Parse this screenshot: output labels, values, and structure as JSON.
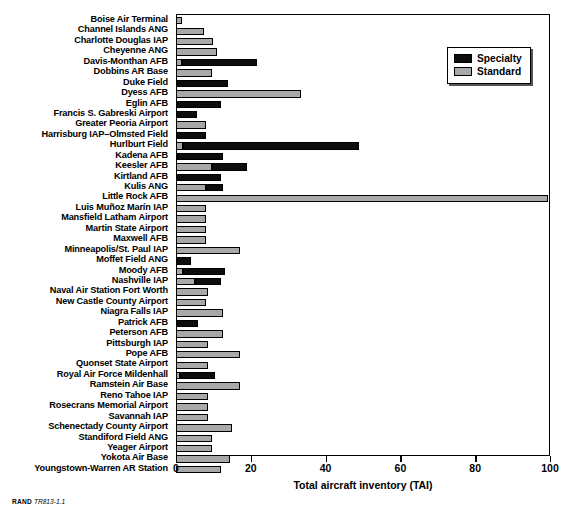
{
  "figure": {
    "footer_label": "RAND",
    "footer_code": "TR813-1.1"
  },
  "legend": {
    "position": "top-right",
    "entries": [
      {
        "label": "Specialty",
        "color": "#0d0d0d"
      },
      {
        "label": "Standard",
        "color": "#a8a8a8"
      }
    ]
  },
  "chart_data": {
    "type": "bar",
    "orientation": "horizontal",
    "stacked": true,
    "title": "",
    "subtitle": "",
    "xlabel": "Total aircraft inventory (TAI)",
    "ylabel": "",
    "xlim": [
      0,
      100
    ],
    "xticks": [
      0,
      20,
      40,
      60,
      80,
      100
    ],
    "xtick_labels": [
      "0",
      "20",
      "40",
      "60",
      "80",
      "100"
    ],
    "grid": false,
    "legend_position": "top-right",
    "categories": [
      "Boise Air Terminal",
      "Channel Islands ANG",
      "Charlotte Douglas IAP",
      "Cheyenne ANG",
      "Davis-Monthan AFB",
      "Dobbins AR Base",
      "Duke Field",
      "Dyess AFB",
      "Eglin AFB",
      "Francis S. Gabreski Airport",
      "Greater Peoria Airport",
      "Harrisburg IAP–Olmsted Field",
      "Hurlburt Field",
      "Kadena AFB",
      "Keesler AFB",
      "Kirtland AFB",
      "Kulis ANG",
      "Little Rock AFB",
      "Luis Muñoz Marín IAP",
      "Mansfield Latham Airport",
      "Martin State Airport",
      "Maxwell AFB",
      "Minneapolis/St. Paul IAP",
      "Moffet Field ANG",
      "Moody AFB",
      "Nashville IAP",
      "Naval Air Station Fort Worth",
      "New Castle County Airport",
      "Niagra Falls IAP",
      "Patrick AFB",
      "Peterson AFB",
      "Pittsburgh IAP",
      "Pope AFB",
      "Quonset State Airport",
      "Royal Air Force Mildenhall",
      "Ramstein Air Base",
      "Reno Tahoe IAP",
      "Rosecrans Memorial Airport",
      "Savannah IAP",
      "Schenectady County Airport",
      "Standiford Field ANG",
      "Yeager Airport",
      "Yokota Air Base",
      "Youngstown-Warren AR Station"
    ],
    "series": [
      {
        "name": "Standard",
        "color": "#a8a8a8",
        "values": [
          1.5,
          7.5,
          10,
          11,
          1.5,
          9.5,
          0,
          33.5,
          0,
          0,
          8,
          0,
          2,
          0.5,
          9.5,
          0,
          8,
          99.5,
          8,
          8,
          8,
          8,
          17,
          0,
          2,
          5,
          8.5,
          8,
          12.5,
          0,
          12.5,
          8.5,
          17,
          8.5,
          1,
          17,
          8.5,
          8.5,
          8.5,
          15,
          9.5,
          9.5,
          14.5,
          12
        ]
      },
      {
        "name": "Specialty",
        "color": "#0d0d0d",
        "values": [
          0,
          0,
          0,
          0,
          20.2,
          0,
          14,
          0,
          12,
          5.5,
          0,
          8,
          47,
          12,
          9.5,
          12,
          4.5,
          0,
          0,
          0,
          0,
          0,
          0,
          4,
          11,
          7,
          0,
          0,
          0,
          6,
          0,
          0,
          0,
          0,
          9.5,
          0,
          0,
          0,
          0,
          0,
          0,
          0,
          0,
          0
        ]
      }
    ],
    "totals": [
      1.5,
      7.5,
      10,
      11,
      21.7,
      9.5,
      14,
      33.5,
      12,
      5.5,
      8,
      8,
      49,
      12.5,
      19,
      12,
      12.5,
      99.5,
      8,
      8,
      8,
      8,
      17,
      4,
      13,
      12,
      8.5,
      8,
      12.5,
      6,
      12.5,
      8.5,
      17,
      8.5,
      10.5,
      17,
      8.5,
      8.5,
      8.5,
      15,
      9.5,
      9.5,
      14.5,
      12
    ]
  }
}
